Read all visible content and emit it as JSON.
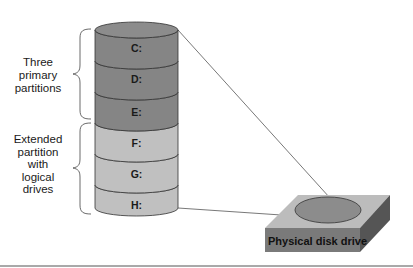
{
  "diagram": {
    "partitions": [
      {
        "label": "C:",
        "type": "primary"
      },
      {
        "label": "D:",
        "type": "primary"
      },
      {
        "label": "E:",
        "type": "primary"
      },
      {
        "label": "F:",
        "type": "logical"
      },
      {
        "label": "G:",
        "type": "logical"
      },
      {
        "label": "H:",
        "type": "logical"
      }
    ],
    "primary_group": {
      "lines": [
        "Three",
        "primary",
        "partitions"
      ]
    },
    "extended_group": {
      "lines": [
        "Extended",
        "partition",
        "with",
        "logical",
        "drives"
      ]
    },
    "disk": {
      "label": "Physical disk drive"
    },
    "colors": {
      "primary": "#858585",
      "logical": "#c0c0c0",
      "disk_top": "#bcbcbc",
      "disk_front": "#7a7a7a",
      "disk_side": "#555555",
      "disk_platter": "#8c8c8c",
      "outline": "#333333"
    }
  }
}
